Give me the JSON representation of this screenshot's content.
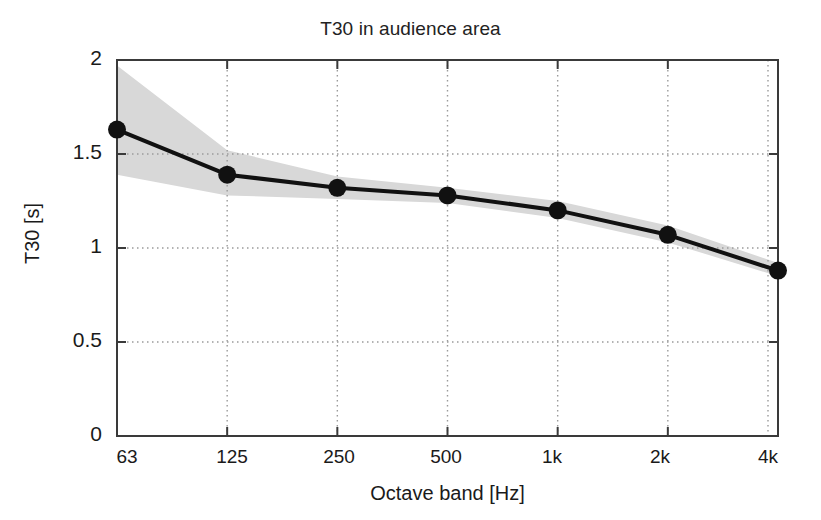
{
  "chart_data": {
    "type": "line",
    "title": "T30 in audience area",
    "xlabel": "Octave band [Hz]",
    "ylabel": "T30 [s]",
    "categories": [
      "63",
      "125",
      "250",
      "500",
      "1k",
      "2k",
      "4k"
    ],
    "x_tick_labels": [
      "63",
      "125",
      "250",
      "500",
      "1k",
      "2k",
      "4k"
    ],
    "y_tick_labels": [
      "0",
      "0.5",
      "1",
      "1.5",
      "2"
    ],
    "y_tick_values": [
      0,
      0.5,
      1,
      1.5,
      2
    ],
    "ylim": [
      0,
      2
    ],
    "grid": "dotted",
    "legend": "none",
    "series": [
      {
        "name": "T30 mean",
        "style": "line-with-markers",
        "color": "#111111",
        "marker": "filled-circle",
        "values": [
          1.63,
          1.39,
          1.32,
          1.28,
          1.2,
          1.07,
          0.88
        ]
      },
      {
        "name": "T30 spread band",
        "style": "shaded-area",
        "color": "#d8d8d8",
        "upper": [
          1.97,
          1.52,
          1.38,
          1.32,
          1.25,
          1.12,
          0.92
        ],
        "lower": [
          1.39,
          1.28,
          1.26,
          1.24,
          1.16,
          1.03,
          0.85
        ]
      }
    ]
  },
  "figure": {
    "title": "T30 in audience area",
    "xaxis_title": "Octave band [Hz]",
    "yaxis_title": "T30 [s]",
    "axis_color": "#3a3a3a",
    "grid_color": "#9a9a9a",
    "band_color": "#dcdcdc",
    "line_color": "#111111",
    "background": "#ffffff"
  },
  "y_ticks": [
    {
      "label": "2",
      "value": 2
    },
    {
      "label": "1.5",
      "value": 1.5
    },
    {
      "label": "1",
      "value": 1
    },
    {
      "label": "0.5",
      "value": 0.5
    },
    {
      "label": "0",
      "value": 0
    }
  ],
  "x_ticks": [
    {
      "label": "63",
      "index": 0
    },
    {
      "label": "125",
      "index": 1
    },
    {
      "label": "250",
      "index": 2
    },
    {
      "label": "500",
      "index": 3
    },
    {
      "label": "1k",
      "index": 4
    },
    {
      "label": "2k",
      "index": 5
    },
    {
      "label": "4k",
      "index": 6
    }
  ]
}
